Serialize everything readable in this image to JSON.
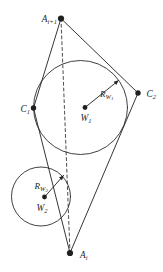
{
  "figure": {
    "background": "#ffffff",
    "line_color": "#1f1f1f",
    "labels": {
      "a_top": {
        "base": "A",
        "sub": "i+1"
      },
      "c1": {
        "base": "C",
        "sub": "1"
      },
      "c2": {
        "base": "C",
        "sub": "2"
      },
      "w1": {
        "base": "W",
        "sub": "1"
      },
      "r_w1": {
        "base": "R",
        "sub": "W",
        "subsub": "1"
      },
      "w2": {
        "base": "W",
        "sub": "2"
      },
      "r_w2": {
        "base": "R",
        "sub": "W",
        "subsub": "2"
      },
      "a_i": {
        "base": "A",
        "sub": "i"
      }
    }
  }
}
